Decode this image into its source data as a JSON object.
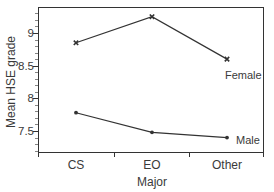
{
  "chart_data": {
    "type": "line",
    "title": "",
    "xlabel": "Major",
    "ylabel": "Mean HSE grade",
    "categories": [
      "CS",
      "EO",
      "Other"
    ],
    "series": [
      {
        "name": "Female",
        "values": [
          8.85,
          9.25,
          8.6
        ],
        "marker": "x"
      },
      {
        "name": "Male",
        "values": [
          7.78,
          7.48,
          7.4
        ],
        "marker": "dot"
      }
    ],
    "ylim": [
      7.2,
      9.4
    ],
    "yticks": [
      7.5,
      8,
      8.5,
      9
    ],
    "ytick_labels": [
      "7.5",
      "8",
      "8.5",
      "9"
    ],
    "minor_ytick_step": 0.1,
    "grid": false,
    "legend": "inline labels at line ends"
  },
  "colors": {
    "line": "#333333",
    "axis": "#333333",
    "text": "#3a3a3a"
  }
}
